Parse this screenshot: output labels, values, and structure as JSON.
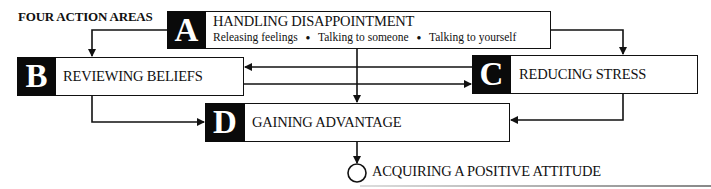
{
  "title": "FOUR ACTION AREAS",
  "areas": [
    {
      "letter": "A",
      "label": "HANDLING DISAPPOINTMENT",
      "items": [
        "Releasing feelings",
        "Talking to someone",
        "Talking to yourself"
      ],
      "bullet": "●"
    },
    {
      "letter": "B",
      "label": "REVIEWING BELIEFS"
    },
    {
      "letter": "C",
      "label": "REDUCING STRESS"
    },
    {
      "letter": "D",
      "label": "GAINING ADVANTAGE"
    }
  ],
  "goal": {
    "label": "ACQUIRING A POSITIVE ATTITUDE"
  },
  "colors": {
    "ink": "#111111",
    "block": "#0a0a0a",
    "paper": "#ffffff"
  }
}
